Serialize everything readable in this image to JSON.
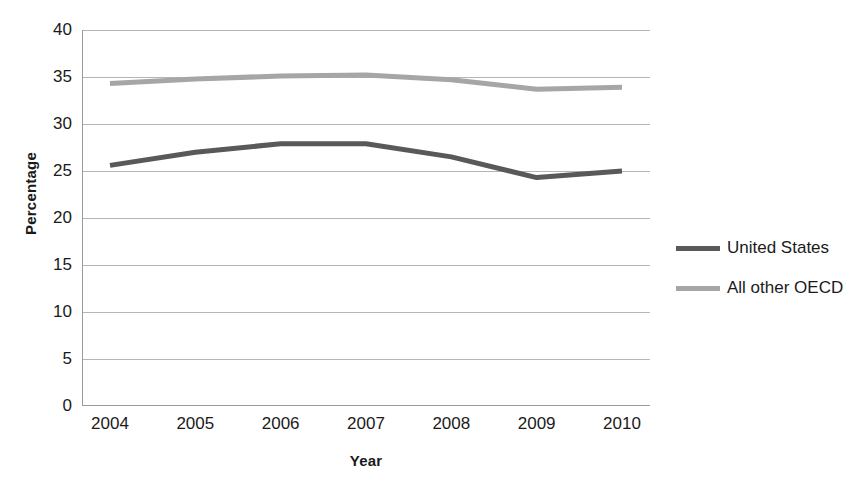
{
  "chart_data": {
    "type": "line",
    "title": "",
    "xlabel": "Year",
    "ylabel": "Percentage",
    "x": [
      2004,
      2005,
      2006,
      2007,
      2008,
      2009,
      2010
    ],
    "xtick_labels": [
      "2004",
      "2005",
      "2006",
      "2007",
      "2008",
      "2009",
      "2010"
    ],
    "ytick_labels": [
      "0",
      "5",
      "10",
      "15",
      "20",
      "25",
      "30",
      "35",
      "40"
    ],
    "yticks": [
      0,
      5,
      10,
      15,
      20,
      25,
      30,
      35,
      40
    ],
    "ylim": [
      0,
      40
    ],
    "grid": true,
    "legend_position": "right",
    "series": [
      {
        "name": "United States",
        "color": "#595959",
        "values": [
          25.6,
          27.0,
          27.9,
          27.9,
          26.5,
          24.3,
          25.0
        ]
      },
      {
        "name": "All other OECD",
        "color": "#a6a6a6",
        "values": [
          34.3,
          34.8,
          35.1,
          35.2,
          34.7,
          33.7,
          33.9
        ]
      }
    ]
  },
  "legend": {
    "entries": [
      {
        "label": "United States",
        "color": "#595959"
      },
      {
        "label": "All other OECD",
        "color": "#a6a6a6"
      }
    ]
  }
}
